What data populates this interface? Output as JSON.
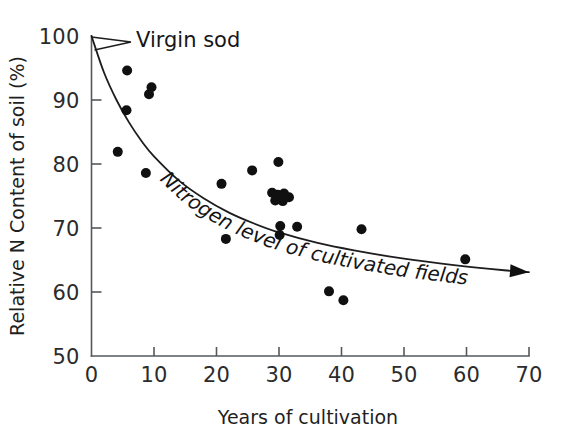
{
  "chart_data": {
    "type": "scatter",
    "title": "",
    "xlabel": "Years of cultivation",
    "ylabel": "Relative N Content of soil (%)",
    "xlim": [
      0,
      70
    ],
    "ylim": [
      50,
      100
    ],
    "xticks": [
      0,
      10,
      20,
      30,
      40,
      50,
      60,
      70
    ],
    "yticks": [
      50,
      60,
      70,
      80,
      90,
      100
    ],
    "grid": false,
    "legend": false,
    "annotations": [
      {
        "name": "virgin-sod",
        "text": "Virgin sod",
        "points_to_x": 0,
        "points_to_y": 100
      },
      {
        "name": "fit-curve-label",
        "text": "Nitrogen level of cultivated fields"
      }
    ],
    "series": [
      {
        "name": "Nitrogen level of cultivated fields",
        "marker": "filled-circle",
        "color": "#101010",
        "points": [
          {
            "x": 5.7,
            "y": 94.6
          },
          {
            "x": 9.6,
            "y": 92.0
          },
          {
            "x": 9.2,
            "y": 90.9
          },
          {
            "x": 5.6,
            "y": 88.4
          },
          {
            "x": 4.2,
            "y": 81.9
          },
          {
            "x": 8.7,
            "y": 78.6
          },
          {
            "x": 21.5,
            "y": 68.3
          },
          {
            "x": 20.8,
            "y": 76.9
          },
          {
            "x": 25.7,
            "y": 79.0
          },
          {
            "x": 29.9,
            "y": 80.3
          },
          {
            "x": 28.9,
            "y": 75.5
          },
          {
            "x": 29.8,
            "y": 75.2
          },
          {
            "x": 30.8,
            "y": 75.4
          },
          {
            "x": 29.4,
            "y": 74.3
          },
          {
            "x": 30.6,
            "y": 74.2
          },
          {
            "x": 31.6,
            "y": 74.8
          },
          {
            "x": 30.2,
            "y": 70.3
          },
          {
            "x": 30.1,
            "y": 68.9
          },
          {
            "x": 32.9,
            "y": 70.2
          },
          {
            "x": 38.0,
            "y": 60.1
          },
          {
            "x": 40.3,
            "y": 58.7
          },
          {
            "x": 43.2,
            "y": 69.8
          },
          {
            "x": 59.8,
            "y": 65.1
          }
        ]
      }
    ],
    "fit_curve": {
      "name": "exponential-decline",
      "description": "Nitrogen level of cultivated fields",
      "arrow_head": true,
      "points": [
        {
          "x": 0.0,
          "y": 100.0
        },
        {
          "x": 2.0,
          "y": 94.3
        },
        {
          "x": 4.0,
          "y": 90.0
        },
        {
          "x": 6.0,
          "y": 86.5
        },
        {
          "x": 8.0,
          "y": 83.6
        },
        {
          "x": 10.0,
          "y": 81.2
        },
        {
          "x": 14.0,
          "y": 77.4
        },
        {
          "x": 18.0,
          "y": 74.6
        },
        {
          "x": 22.0,
          "y": 72.4
        },
        {
          "x": 26.0,
          "y": 70.7
        },
        {
          "x": 30.0,
          "y": 69.3
        },
        {
          "x": 36.0,
          "y": 67.7
        },
        {
          "x": 42.0,
          "y": 66.5
        },
        {
          "x": 50.0,
          "y": 65.2
        },
        {
          "x": 58.0,
          "y": 64.2
        },
        {
          "x": 66.0,
          "y": 63.4
        },
        {
          "x": 70.0,
          "y": 63.1
        }
      ]
    }
  },
  "axes": {
    "x_tick_labels": [
      "0",
      "10",
      "20",
      "30",
      "40",
      "50",
      "60",
      "70"
    ],
    "y_tick_labels": [
      "50",
      "60",
      "70",
      "80",
      "90",
      "100"
    ],
    "x_axis_title": "Years of cultivation",
    "y_axis_title": "Relative N Content of soil (%)"
  },
  "labels": {
    "virgin_sod": "Virgin sod",
    "curve_label": "Nitrogen level of cultivated fields"
  },
  "colors": {
    "marker": "#101010",
    "axis": "#55595c",
    "curve": "#1d1d1d",
    "background": "#ffffff"
  }
}
